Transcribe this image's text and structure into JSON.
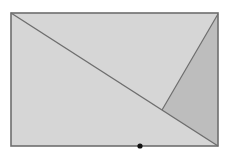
{
  "diagram": {
    "type": "geometry",
    "colors": {
      "background": "#ffffff",
      "rect_fill": "#d6d6d6",
      "shaded_fill": "#bdbdbd",
      "stroke": "#6e6e6e",
      "point": "#111111"
    },
    "rectangle": {
      "x1": 11,
      "y1": 13,
      "x2": 218,
      "y2": 146
    },
    "diagonal": {
      "from": [
        11,
        13
      ],
      "to": [
        218,
        146
      ]
    },
    "fold_line": {
      "from": [
        218,
        14
      ],
      "to": [
        162,
        110
      ]
    },
    "shaded_triangle": [
      [
        218,
        14
      ],
      [
        162,
        110
      ],
      [
        218,
        146
      ]
    ],
    "point": {
      "x": 140,
      "y": 146,
      "r": 2.6
    }
  }
}
